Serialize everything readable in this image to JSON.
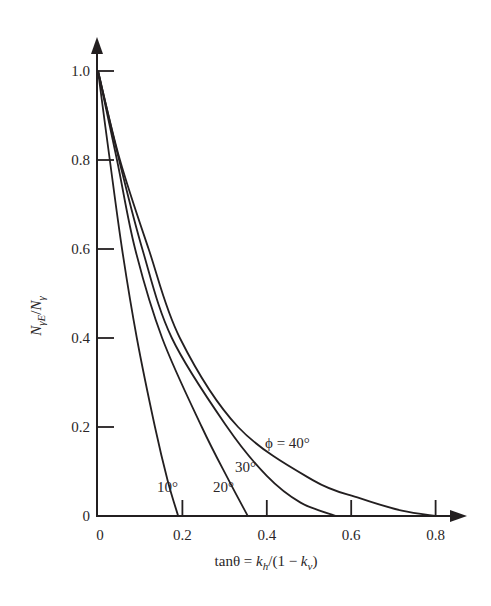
{
  "chart_data": {
    "type": "line",
    "title": "",
    "xlabel": "tanθ = k_h/(1 − k_v)",
    "ylabel": "N_γE/N_γ",
    "xlim": [
      0,
      0.85
    ],
    "ylim": [
      0,
      1.05
    ],
    "grid": false,
    "legend": "inline curve labels",
    "x_ticks": [
      0,
      0.2,
      0.4,
      0.6,
      0.8
    ],
    "x_tick_labels": [
      "0",
      "0.2",
      "0.4",
      "0.6",
      "0.8"
    ],
    "y_ticks": [
      0,
      0.2,
      0.4,
      0.6,
      0.8,
      1.0
    ],
    "y_tick_labels": [
      "0",
      "0.2",
      "0.4",
      "0.6",
      "0.8",
      "1.0"
    ],
    "series": [
      {
        "name": "10°",
        "label": "10°",
        "x": [
          0,
          0.028,
          0.057,
          0.092,
          0.135,
          0.165,
          0.19
        ],
        "y": [
          1.0,
          0.8,
          0.6,
          0.4,
          0.2,
          0.08,
          0.0
        ]
      },
      {
        "name": "20°",
        "label": "20°",
        "x": [
          0,
          0.045,
          0.088,
          0.152,
          0.246,
          0.31,
          0.355
        ],
        "y": [
          1.0,
          0.8,
          0.6,
          0.4,
          0.2,
          0.08,
          0.0
        ]
      },
      {
        "name": "30°",
        "label": "30°",
        "x": [
          0,
          0.05,
          0.105,
          0.175,
          0.306,
          0.4,
          0.48,
          0.565
        ],
        "y": [
          1.0,
          0.8,
          0.6,
          0.4,
          0.2,
          0.09,
          0.03,
          0.0
        ]
      },
      {
        "name": "40°",
        "label": "ϕ = 40°",
        "x": [
          0,
          0.052,
          0.12,
          0.194,
          0.332,
          0.51,
          0.62,
          0.72,
          0.8
        ],
        "y": [
          1.0,
          0.8,
          0.6,
          0.4,
          0.2,
          0.08,
          0.04,
          0.012,
          0.0
        ]
      }
    ]
  },
  "labels": {
    "x_axis_title": "tanθ = ",
    "x_axis_kh": "k",
    "x_axis_kh_sub": "h",
    "x_axis_mid": "/(1 − ",
    "x_axis_kv": "k",
    "x_axis_kv_sub": "v",
    "x_axis_end": ")",
    "y_axis_N1": "N",
    "y_axis_sub1": "γE",
    "y_axis_slash": "/",
    "y_axis_N2": "N",
    "y_axis_sub2": "γ",
    "curve_10": "10°",
    "curve_20": "20°",
    "curve_30": "30°",
    "curve_40": "ϕ = 40°"
  },
  "colors": {
    "ink": "#231f20",
    "background": "#ffffff"
  }
}
